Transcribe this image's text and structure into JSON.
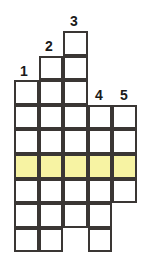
{
  "figure": {
    "type": "grid-diagram",
    "columns": 5,
    "rows": 9,
    "cell_size_px": 24.6,
    "origin": {
      "x": 14,
      "y": 31
    },
    "colors": {
      "grid_line": "#3a3634",
      "cell_background": "#ffffff",
      "highlight": "#f7f3a3",
      "label_text": "#1a1a1a",
      "page_background": "#ffffff"
    }
  },
  "labels": [
    {
      "text": "1",
      "column": 1,
      "x": 16,
      "y": 64
    },
    {
      "text": "2",
      "column": 2,
      "x": 41,
      "y": 39
    },
    {
      "text": "3",
      "column": 3,
      "x": 66,
      "y": 14
    },
    {
      "text": "4",
      "column": 4,
      "x": 91,
      "y": 88
    },
    {
      "text": "5",
      "column": 5,
      "x": 116,
      "y": 88
    }
  ],
  "columns": [
    {
      "index": 1,
      "label": "1",
      "top_row": 3,
      "bottom_row": 9,
      "height_cells": 7
    },
    {
      "index": 2,
      "label": "2",
      "top_row": 2,
      "bottom_row": 9,
      "height_cells": 8
    },
    {
      "index": 3,
      "label": "3",
      "top_row": 1,
      "bottom_row": 9,
      "height_cells": 9
    },
    {
      "index": 4,
      "label": "4",
      "top_row": 4,
      "bottom_row": 9,
      "height_cells": 6
    },
    {
      "index": 5,
      "label": "5",
      "top_row": 4,
      "bottom_row": 7,
      "height_cells": 4
    }
  ],
  "highlighted_row": {
    "row": 6,
    "columns": [
      1,
      2,
      3,
      4,
      5
    ],
    "color": "#f7f3a3"
  },
  "missing_cells": [
    {
      "row": 9,
      "column": 3
    },
    {
      "row": 8,
      "column": 5
    },
    {
      "row": 9,
      "column": 5
    }
  ],
  "cells": [
    {
      "row": 1,
      "column": 3,
      "filled": false
    },
    {
      "row": 2,
      "column": 2,
      "filled": false
    },
    {
      "row": 2,
      "column": 3,
      "filled": false
    },
    {
      "row": 3,
      "column": 1,
      "filled": false
    },
    {
      "row": 3,
      "column": 2,
      "filled": false
    },
    {
      "row": 3,
      "column": 3,
      "filled": false
    },
    {
      "row": 4,
      "column": 1,
      "filled": false
    },
    {
      "row": 4,
      "column": 2,
      "filled": false
    },
    {
      "row": 4,
      "column": 3,
      "filled": false
    },
    {
      "row": 4,
      "column": 4,
      "filled": false
    },
    {
      "row": 4,
      "column": 5,
      "filled": false
    },
    {
      "row": 5,
      "column": 1,
      "filled": false
    },
    {
      "row": 5,
      "column": 2,
      "filled": false
    },
    {
      "row": 5,
      "column": 3,
      "filled": false
    },
    {
      "row": 5,
      "column": 4,
      "filled": false
    },
    {
      "row": 5,
      "column": 5,
      "filled": false
    },
    {
      "row": 6,
      "column": 1,
      "filled": true
    },
    {
      "row": 6,
      "column": 2,
      "filled": true
    },
    {
      "row": 6,
      "column": 3,
      "filled": true
    },
    {
      "row": 6,
      "column": 4,
      "filled": true
    },
    {
      "row": 6,
      "column": 5,
      "filled": true
    },
    {
      "row": 7,
      "column": 1,
      "filled": false
    },
    {
      "row": 7,
      "column": 2,
      "filled": false
    },
    {
      "row": 7,
      "column": 3,
      "filled": false
    },
    {
      "row": 7,
      "column": 4,
      "filled": false
    },
    {
      "row": 7,
      "column": 5,
      "filled": false
    },
    {
      "row": 8,
      "column": 1,
      "filled": false
    },
    {
      "row": 8,
      "column": 2,
      "filled": false
    },
    {
      "row": 8,
      "column": 3,
      "filled": false
    },
    {
      "row": 8,
      "column": 4,
      "filled": false
    },
    {
      "row": 9,
      "column": 1,
      "filled": false
    },
    {
      "row": 9,
      "column": 2,
      "filled": false
    },
    {
      "row": 9,
      "column": 4,
      "filled": false
    }
  ]
}
